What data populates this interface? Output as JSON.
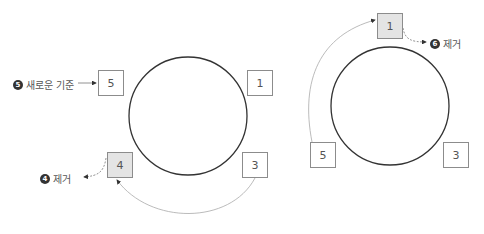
{
  "left_ring": {
    "nodes": [
      {
        "id": "5",
        "label": "5",
        "shaded": false
      },
      {
        "id": "1",
        "label": "1",
        "shaded": false
      },
      {
        "id": "4",
        "label": "4",
        "shaded": true
      },
      {
        "id": "3",
        "label": "3",
        "shaded": false
      }
    ],
    "annotations": [
      {
        "step": "5",
        "text": "새로운 기준",
        "target": "5"
      },
      {
        "step": "4",
        "text": "제거",
        "target": "4"
      }
    ]
  },
  "right_ring": {
    "nodes": [
      {
        "id": "1",
        "label": "1",
        "shaded": true
      },
      {
        "id": "5",
        "label": "5",
        "shaded": false
      },
      {
        "id": "3",
        "label": "3",
        "shaded": false
      }
    ],
    "annotations": [
      {
        "step": "6",
        "text": "제거",
        "target": "1"
      }
    ]
  },
  "colors": {
    "circle_stroke": "#333333",
    "box_border": "#8c8c8c",
    "shaded_fill": "#e4e4e4",
    "arrow": "#999999"
  }
}
